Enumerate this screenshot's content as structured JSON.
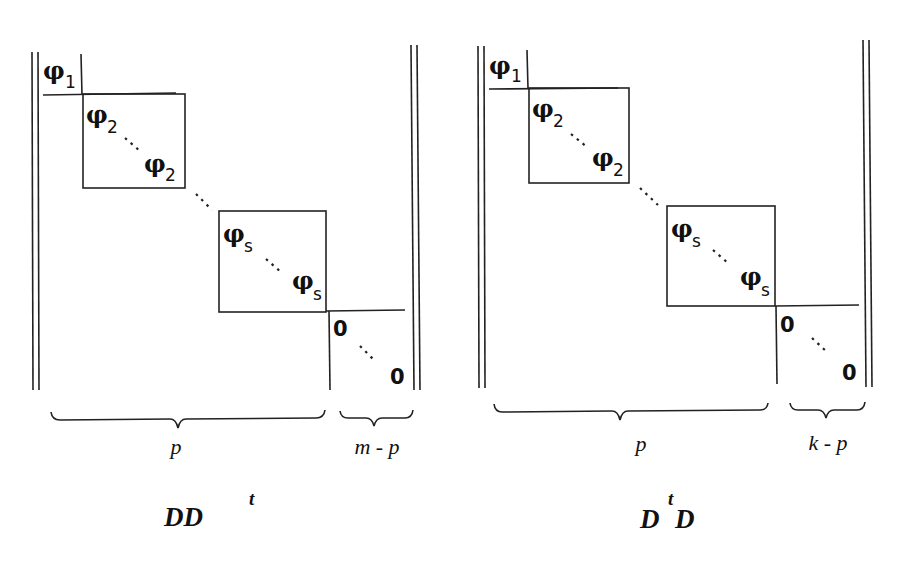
{
  "diagrams": [
    {
      "caption": {
        "base": "DD",
        "sup": "t"
      },
      "blocks": {
        "phi1": {
          "symbol": "φ",
          "sub": "1"
        },
        "phi2_top": {
          "symbol": "φ",
          "sub": "2"
        },
        "phi2_bottom": {
          "symbol": "φ",
          "sub": "2"
        },
        "phis_top": {
          "symbol": "φ",
          "sub": "s"
        },
        "phis_bottom": {
          "symbol": "φ",
          "sub": "s"
        },
        "zero_top": "0",
        "zero_bottom": "0"
      },
      "braces": [
        {
          "label": "p"
        },
        {
          "label": "m - p"
        }
      ]
    },
    {
      "caption": {
        "base_left": "D",
        "sup": "t",
        "base_right": "D"
      },
      "blocks": {
        "phi1": {
          "symbol": "φ",
          "sub": "1"
        },
        "phi2_top": {
          "symbol": "φ",
          "sub": "2"
        },
        "phi2_bottom": {
          "symbol": "φ",
          "sub": "2"
        },
        "phis_top": {
          "symbol": "φ",
          "sub": "s"
        },
        "phis_bottom": {
          "symbol": "φ",
          "sub": "s"
        },
        "zero_top": "0",
        "zero_bottom": "0"
      },
      "braces": [
        {
          "label": "p"
        },
        {
          "label": "k - p"
        }
      ]
    }
  ]
}
